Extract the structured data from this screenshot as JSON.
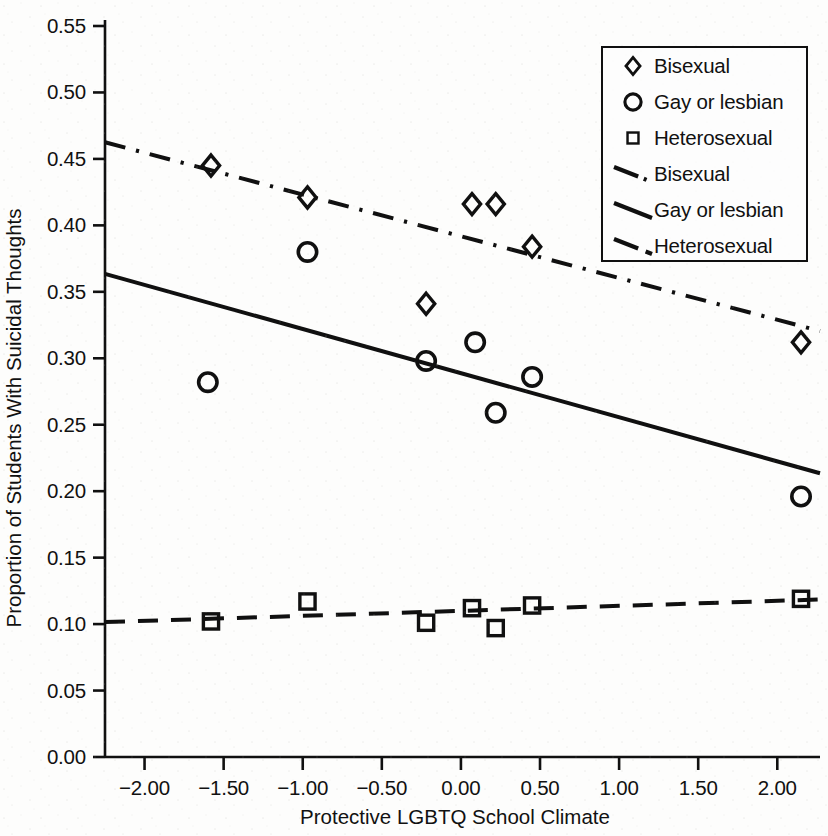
{
  "chart_data": {
    "type": "scatter",
    "title": "",
    "xlabel": "Protective LGBTQ School Climate",
    "ylabel": "Proportion of Students With Suicidal Thoughts",
    "xlim": [
      -2.25,
      2.27
    ],
    "ylim": [
      0.0,
      0.55
    ],
    "grid": false,
    "legend_position": "top-right",
    "xticks": [
      "-2.00",
      "-1.50",
      "-1.00",
      "-0.50",
      "0.00",
      "0.50",
      "1.00",
      "1.50",
      "2.00"
    ],
    "xtick_values": [
      -2.0,
      -1.5,
      -1.0,
      -0.5,
      0.0,
      0.5,
      1.0,
      1.5,
      2.0
    ],
    "yticks": [
      "0.00",
      "0.05",
      "0.10",
      "0.15",
      "0.20",
      "0.25",
      "0.30",
      "0.35",
      "0.40",
      "0.45",
      "0.50",
      "0.55"
    ],
    "ytick_values": [
      0.0,
      0.05,
      0.1,
      0.15,
      0.2,
      0.25,
      0.3,
      0.35,
      0.4,
      0.45,
      0.5,
      0.55
    ],
    "series": [
      {
        "name": "Bisexual",
        "kind": "scatter",
        "marker": "diamond",
        "color": "#101010",
        "points": [
          {
            "x": -1.58,
            "y": 0.445
          },
          {
            "x": -0.97,
            "y": 0.421
          },
          {
            "x": -0.22,
            "y": 0.341
          },
          {
            "x": 0.07,
            "y": 0.416
          },
          {
            "x": 0.22,
            "y": 0.416
          },
          {
            "x": 0.45,
            "y": 0.384
          },
          {
            "x": 2.15,
            "y": 0.312
          }
        ]
      },
      {
        "name": "Gay or lesbian",
        "kind": "scatter",
        "marker": "circle",
        "color": "#101010",
        "points": [
          {
            "x": -1.6,
            "y": 0.282
          },
          {
            "x": -0.97,
            "y": 0.38
          },
          {
            "x": -0.22,
            "y": 0.298
          },
          {
            "x": 0.09,
            "y": 0.312
          },
          {
            "x": 0.22,
            "y": 0.259
          },
          {
            "x": 0.45,
            "y": 0.286
          },
          {
            "x": 2.15,
            "y": 0.196
          }
        ]
      },
      {
        "name": "Heterosexual",
        "kind": "scatter",
        "marker": "square",
        "color": "#101010",
        "points": [
          {
            "x": -1.58,
            "y": 0.102
          },
          {
            "x": -0.97,
            "y": 0.117
          },
          {
            "x": -0.22,
            "y": 0.101
          },
          {
            "x": 0.07,
            "y": 0.112
          },
          {
            "x": 0.22,
            "y": 0.097
          },
          {
            "x": 0.45,
            "y": 0.114
          },
          {
            "x": 2.15,
            "y": 0.119
          }
        ]
      },
      {
        "name": "Bisexual",
        "kind": "trendline",
        "linestyle": "dashdot",
        "color": "#101010",
        "endpoints": [
          {
            "x": -2.25,
            "y": 0.4625
          },
          {
            "x": 2.27,
            "y": 0.3205
          }
        ]
      },
      {
        "name": "Gay or lesbian",
        "kind": "trendline",
        "linestyle": "solid",
        "color": "#101010",
        "endpoints": [
          {
            "x": -2.25,
            "y": 0.3635
          },
          {
            "x": 2.27,
            "y": 0.2135
          }
        ]
      },
      {
        "name": "Heterosexual",
        "kind": "trendline",
        "linestyle": "dashed",
        "color": "#101010",
        "endpoints": [
          {
            "x": -2.25,
            "y": 0.1015
          },
          {
            "x": 2.27,
            "y": 0.1185
          }
        ]
      }
    ]
  },
  "legend": {
    "entries": [
      {
        "label": "Bisexual",
        "key": "diamond-marker"
      },
      {
        "label": "Gay or lesbian",
        "key": "circle-marker"
      },
      {
        "label": "Heterosexual",
        "key": "square-marker"
      },
      {
        "label": "Bisexual",
        "key": "dashdot-line"
      },
      {
        "label": "Gay or lesbian",
        "key": "solid-line"
      },
      {
        "label": "Heterosexual",
        "key": "dashed-line"
      }
    ]
  }
}
